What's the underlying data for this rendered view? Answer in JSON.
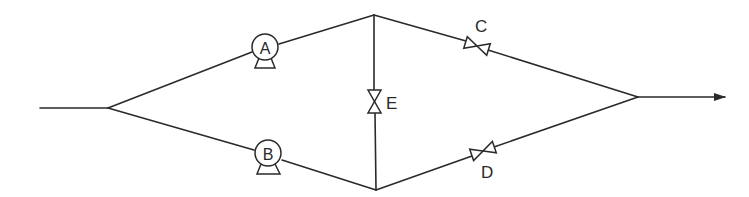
{
  "diagram": {
    "type": "piping-flow-schematic",
    "colors": {
      "line": "#2a2a2a",
      "background": "#ffffff"
    },
    "nodes": {
      "inlet": [
        40,
        108
      ],
      "split": [
        108,
        108
      ],
      "top_junction": [
        374,
        15
      ],
      "bottom_junction": [
        376,
        190
      ],
      "merge": [
        638,
        97
      ],
      "outlet": [
        725,
        97
      ]
    },
    "pumps": [
      {
        "id": "A",
        "label": "A",
        "branch": "upper"
      },
      {
        "id": "B",
        "label": "B",
        "branch": "lower"
      }
    ],
    "valves": [
      {
        "id": "C",
        "label": "C",
        "branch": "upper-right"
      },
      {
        "id": "D",
        "label": "D",
        "branch": "lower-right"
      },
      {
        "id": "E",
        "label": "E",
        "branch": "vertical cross-connection"
      }
    ],
    "flow_direction": "left-to-right",
    "outlet_arrow": "arrow-right"
  }
}
